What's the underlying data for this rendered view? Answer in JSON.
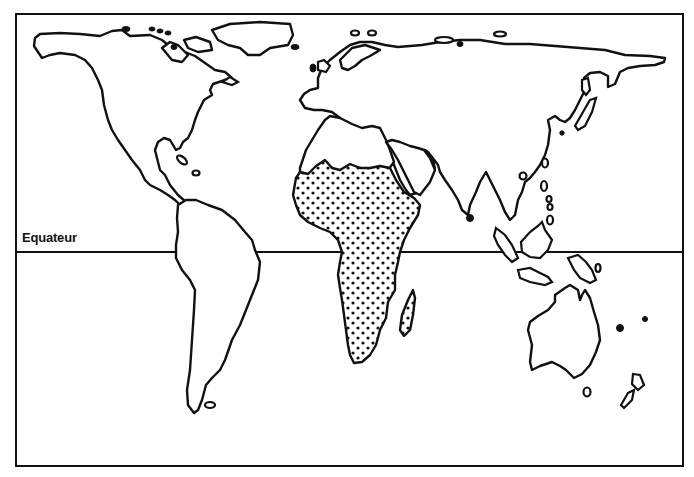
{
  "map": {
    "type": "world-outline-map",
    "equator_label": "Equateur",
    "highlighted_region": "sub-saharan-africa",
    "highlight_pattern": "dotted",
    "colors": {
      "outline": "#111111",
      "background": "#ffffff",
      "dots": "#111111"
    },
    "continents": [
      "north-america",
      "south-america",
      "europe",
      "asia",
      "africa",
      "australia",
      "greenland",
      "madagascar",
      "new-zealand",
      "japan",
      "indonesia",
      "british-isles"
    ]
  }
}
